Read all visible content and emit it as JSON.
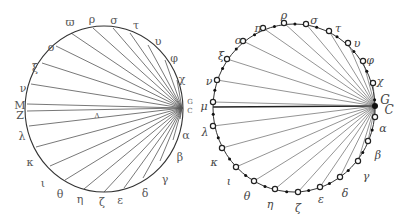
{
  "figure": {
    "left_diagram": {
      "description": "Hand-drawn circle with chords from point G/C to lettered points on circumference",
      "center": [
        104,
        109
      ],
      "rx": 79,
      "ry": 83,
      "hub_labels": {
        "upper": "G",
        "lower": "C"
      },
      "inner_label": "Λ",
      "points": [
        {
          "label": "ϖ",
          "x": 71,
          "y": 33,
          "lx": 70,
          "ly": 22
        },
        {
          "label": "ρ",
          "x": 93,
          "y": 28,
          "lx": 92,
          "ly": 19
        },
        {
          "label": "σ",
          "x": 113,
          "y": 28,
          "lx": 114,
          "ly": 20
        },
        {
          "label": "τ",
          "x": 130,
          "y": 33,
          "lx": 136,
          "ly": 25
        },
        {
          "label": "υ",
          "x": 148,
          "y": 45,
          "lx": 158,
          "ly": 41
        },
        {
          "label": "φ",
          "x": 165,
          "y": 60,
          "lx": 174,
          "ly": 58
        },
        {
          "label": "χ",
          "x": 177,
          "y": 80,
          "lx": 182,
          "ly": 79
        },
        {
          "label": "α",
          "x": 180,
          "y": 119,
          "lx": 186,
          "ly": 135
        },
        {
          "label": "β",
          "x": 173,
          "y": 140,
          "lx": 180,
          "ly": 157
        },
        {
          "label": "γ",
          "x": 160,
          "y": 161,
          "lx": 165,
          "ly": 179
        },
        {
          "label": "δ",
          "x": 143,
          "y": 178,
          "lx": 145,
          "ly": 193
        },
        {
          "label": "ε",
          "x": 124,
          "y": 188,
          "lx": 120,
          "ly": 200
        },
        {
          "label": "ζ",
          "x": 104,
          "y": 192,
          "lx": 102,
          "ly": 202
        },
        {
          "label": "η",
          "x": 84,
          "y": 189,
          "lx": 80,
          "ly": 199
        },
        {
          "label": "θ",
          "x": 65,
          "y": 180,
          "lx": 60,
          "ly": 194
        },
        {
          "label": "ι",
          "x": 50,
          "y": 166,
          "lx": 43,
          "ly": 183
        },
        {
          "label": "κ",
          "x": 36,
          "y": 147,
          "lx": 30,
          "ly": 162
        },
        {
          "label": "λ",
          "x": 29,
          "y": 126,
          "lx": 22,
          "ly": 136
        },
        {
          "label": "Ζ",
          "x": 27,
          "y": 111,
          "lx": 20,
          "ly": 115
        },
        {
          "label": "Μ",
          "x": 27,
          "y": 104,
          "lx": 20,
          "ly": 105
        },
        {
          "label": "ν",
          "x": 31,
          "y": 84,
          "lx": 23,
          "ly": 88
        },
        {
          "label": "ξ",
          "x": 42,
          "y": 63,
          "lx": 35,
          "ly": 68
        },
        {
          "label": "ο",
          "x": 56,
          "y": 46,
          "lx": 51,
          "ly": 47
        }
      ]
    },
    "right_diagram": {
      "description": "Circle with open and filled markers; chords from point G/C to each open marker",
      "center": [
        294,
        108
      ],
      "rx": 81,
      "ry": 84,
      "hub": {
        "x": 375,
        "y": 106,
        "labels": {
          "upper": "G",
          "lower": "C"
        }
      },
      "points": [
        {
          "label": "ρ",
          "x": 284,
          "y": 23,
          "lx": 284,
          "ly": 15
        },
        {
          "label": "σ",
          "x": 306,
          "y": 24,
          "lx": 314,
          "ly": 20
        },
        {
          "label": "τ",
          "x": 329,
          "y": 31,
          "lx": 338,
          "ly": 28
        },
        {
          "label": "υ",
          "x": 348,
          "y": 43,
          "lx": 357,
          "ly": 43
        },
        {
          "label": "φ",
          "x": 363,
          "y": 61,
          "lx": 370,
          "ly": 60
        },
        {
          "label": "χ",
          "x": 373,
          "y": 83,
          "lx": 380,
          "ly": 81
        },
        {
          "label": "α",
          "x": 375,
          "y": 117,
          "lx": 383,
          "ly": 128
        },
        {
          "label": "β",
          "x": 368,
          "y": 141,
          "lx": 378,
          "ly": 155
        },
        {
          "label": "γ",
          "x": 358,
          "y": 161,
          "lx": 366,
          "ly": 176
        },
        {
          "label": "δ",
          "x": 340,
          "y": 177,
          "lx": 345,
          "ly": 193
        },
        {
          "label": "ε",
          "x": 320,
          "y": 187,
          "lx": 321,
          "ly": 199
        },
        {
          "label": "ζ",
          "x": 298,
          "y": 192,
          "lx": 298,
          "ly": 208
        },
        {
          "label": "η",
          "x": 275,
          "y": 189,
          "lx": 270,
          "ly": 204
        },
        {
          "label": "θ",
          "x": 254,
          "y": 181,
          "lx": 247,
          "ly": 196
        },
        {
          "label": "ι",
          "x": 236,
          "y": 167,
          "lx": 229,
          "ly": 181
        },
        {
          "label": "κ",
          "x": 222,
          "y": 148,
          "lx": 214,
          "ly": 162
        },
        {
          "label": "λ",
          "x": 213,
          "y": 126,
          "lx": 205,
          "ly": 132
        },
        {
          "label": "μ",
          "x": 213,
          "y": 102,
          "lx": 204,
          "ly": 106
        },
        {
          "label": "ν",
          "x": 217,
          "y": 80,
          "lx": 209,
          "ly": 81
        },
        {
          "label": "ξ",
          "x": 227,
          "y": 59,
          "lx": 221,
          "ly": 56
        },
        {
          "label": "ο",
          "x": 243,
          "y": 41,
          "lx": 238,
          "ly": 40
        },
        {
          "label": "π",
          "x": 263,
          "y": 28,
          "lx": 258,
          "ly": 28
        }
      ]
    }
  }
}
